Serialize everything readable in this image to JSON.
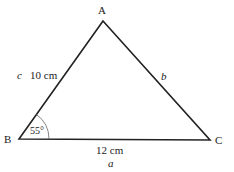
{
  "diagram": {
    "type": "triangle",
    "vertices": {
      "A": {
        "label": "A"
      },
      "B": {
        "label": "B"
      },
      "C": {
        "label": "C"
      }
    },
    "sides": {
      "c": {
        "name": "c",
        "length": "10 cm"
      },
      "b": {
        "name": "b"
      },
      "a": {
        "name": "a",
        "length": "12 cm"
      }
    },
    "angle_B": "55°"
  }
}
